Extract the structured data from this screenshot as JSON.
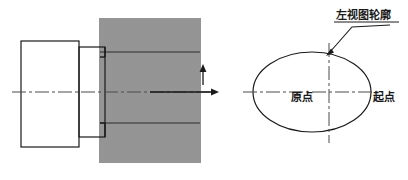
{
  "figure": {
    "background_color": "#ffffff",
    "line_color": "#1a1a1a",
    "center_line_color": "#4a4a4a",
    "hatch_color": "#2b2b2b",
    "width": 408,
    "height": 180
  },
  "left_view": {
    "name": "主视图",
    "body_rect": {
      "x": 21,
      "y": 41,
      "width": 58,
      "height": 106
    },
    "step_rect": {
      "x": 79,
      "y": 47,
      "width": 26,
      "height": 90
    },
    "hatch_region": {
      "x": 100,
      "y": 18,
      "width": 100,
      "height": 145,
      "stripe_spacing": 2
    },
    "cross_lines_y": [
      52,
      123
    ],
    "connector_lines_y": [
      57,
      123
    ],
    "center_line": {
      "x1": 12,
      "x2": 214,
      "y": 92
    },
    "feed_arrow": {
      "x1": 150,
      "y1": 92,
      "x2": 218,
      "y2": 92,
      "direction": "right"
    },
    "tool_arrow": {
      "x": 203,
      "y1": 84,
      "y2": 66,
      "direction": "up"
    }
  },
  "right_view": {
    "name": "左视图",
    "ellipse": {
      "cx": 312,
      "cy": 92,
      "rx": 59,
      "ry": 40
    },
    "h_center_line": {
      "x1": 243,
      "x2": 382,
      "y": 92
    },
    "v_center_line": {
      "x": 329,
      "y1": 43,
      "y2": 143
    },
    "leader": {
      "x1": 390,
      "y1": 24,
      "x2": 352,
      "y2": 28,
      "x3": 327,
      "y3": 55
    }
  },
  "labels": {
    "contour": {
      "text": "左视图轮廓",
      "x": 336,
      "y": 19,
      "underline": true
    },
    "origin": {
      "text": "原点",
      "x": 291,
      "y": 101
    },
    "start_point": {
      "text": "起点",
      "x": 373,
      "y": 101
    }
  }
}
